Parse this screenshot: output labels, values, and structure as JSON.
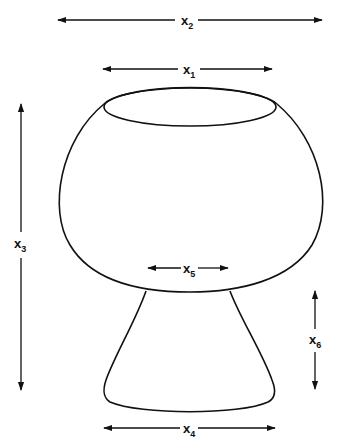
{
  "diagram": {
    "type": "technical-dimension-drawing",
    "stroke_color": "#111111",
    "background_color": "#ffffff"
  },
  "dimensions": [
    {
      "id": "x1",
      "base": "x",
      "sub": "1",
      "meaning": "rim opening width",
      "orientation": "horizontal"
    },
    {
      "id": "x2",
      "base": "x",
      "sub": "2",
      "meaning": "maximum bowl width",
      "orientation": "horizontal"
    },
    {
      "id": "x3",
      "base": "x",
      "sub": "3",
      "meaning": "total height",
      "orientation": "vertical"
    },
    {
      "id": "x4",
      "base": "x",
      "sub": "4",
      "meaning": "foot base width",
      "orientation": "horizontal"
    },
    {
      "id": "x5",
      "base": "x",
      "sub": "5",
      "meaning": "stem neck width",
      "orientation": "horizontal"
    },
    {
      "id": "x6",
      "base": "x",
      "sub": "6",
      "meaning": "foot height",
      "orientation": "vertical"
    }
  ]
}
